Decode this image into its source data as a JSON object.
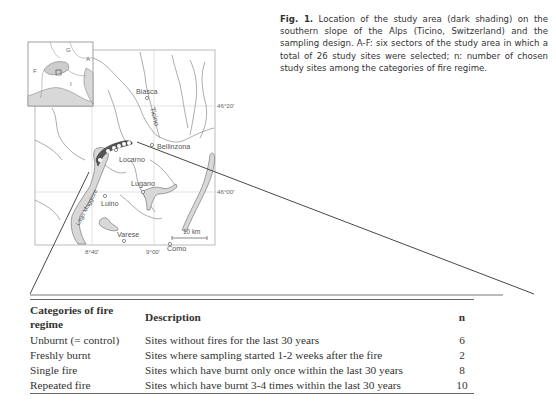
{
  "caption": {
    "fig_label": "Fig. 1.",
    "text": "Location of the study area (dark shading) on the southern slope of the Alps (Ticino, Switzerland) and the sampling design. A-F: six sectors of the study area in which a total of 26 study sites were selected; n: number of chosen study sites among the categories of fire regime."
  },
  "map": {
    "inset_labels": [
      "G",
      "A",
      "F",
      "I"
    ],
    "places": {
      "biasca": "Biasca",
      "ticino_river": "Ticino",
      "bellinzona": "Bellinzona",
      "locarno": "Locarno",
      "lugano": "Lugano",
      "luino": "Luino",
      "lago_maggiore": "Lago Maggiore",
      "varese": "Varese",
      "como": "Como"
    },
    "coords": {
      "lat_1": "46°20'",
      "lat_2": "46°00'",
      "lon_1": "8°40'",
      "lon_2": "9°00'"
    },
    "scale_bar": "10 km",
    "sectors": [
      "A",
      "B",
      "C",
      "D",
      "E",
      "F"
    ],
    "colors": {
      "study_area": "#555555",
      "lake_fill": "#d8d8d8",
      "border_line": "#777777",
      "grid_line": "#cccccc"
    }
  },
  "table": {
    "headers": {
      "category": "Categories of fire regime",
      "description": "Description",
      "n": "n"
    },
    "rows": [
      {
        "category": "Unburnt (= control)",
        "description": "Sites without fires for the last 30 years",
        "n": "6"
      },
      {
        "category": "Freshly burnt",
        "description": "Sites where sampling started 1-2 weeks after the fire",
        "n": "2"
      },
      {
        "category": "Single fire",
        "description": "Sites which have burnt only once within the last 30 years",
        "n": "8"
      },
      {
        "category": "Repeated fire",
        "description": "Sites which have burnt 3-4 times within the last 30 years",
        "n": "10"
      }
    ]
  }
}
